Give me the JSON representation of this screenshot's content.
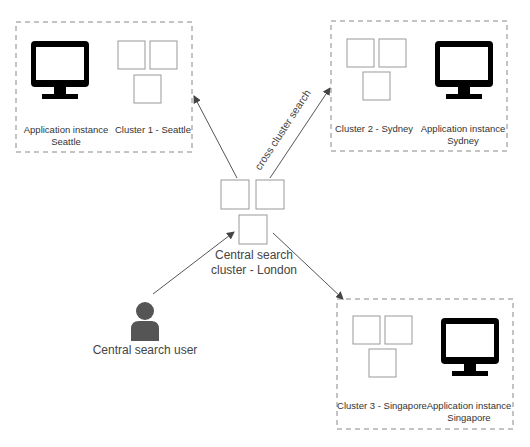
{
  "diagram": {
    "regions": [
      {
        "id": "seattle",
        "app_label_line1": "Application instance",
        "app_label_line2": "Seattle",
        "cluster_label": "Cluster 1 - Seattle"
      },
      {
        "id": "sydney",
        "app_label_line1": "Application instance",
        "app_label_line2": "Sydney",
        "cluster_label": "Cluster 2 - Sydney"
      },
      {
        "id": "singapore",
        "app_label_line1": "Application instance",
        "app_label_line2": "Singapore",
        "cluster_label": "Cluster 3 - Singapore"
      }
    ],
    "central": {
      "label_line1": "Central search",
      "label_line2": "cluster - London"
    },
    "user": {
      "label": "Central search user",
      "icon": "user-icon"
    },
    "edge_label": "cross cluster search",
    "colors": {
      "dashed_border": "#888888",
      "node_border": "#999999",
      "monitor": "#000000",
      "user": "#555555",
      "arrow": "#555555"
    }
  }
}
